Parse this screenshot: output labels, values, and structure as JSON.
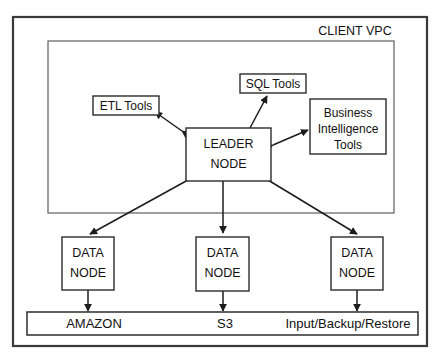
{
  "diagram": {
    "title": "CLIENT VPC",
    "outer_frame": {
      "name": "outer-frame"
    },
    "vpc_region": {
      "label": "CLIENT VPC",
      "label_position": "top-right"
    },
    "nodes": [
      {
        "id": "etl-tools",
        "label": "ETL Tools",
        "lines": [
          "ETL Tools"
        ],
        "kind": "tool"
      },
      {
        "id": "sql-tools",
        "label": "SQL Tools",
        "lines": [
          "SQL Tools"
        ],
        "kind": "tool"
      },
      {
        "id": "bi-tools",
        "label": "Business Intelligence Tools",
        "lines": [
          "Business",
          "Intelligence",
          "Tools"
        ],
        "kind": "tool"
      },
      {
        "id": "leader-node",
        "label": "LEADER NODE",
        "lines": [
          "LEADER",
          "NODE"
        ],
        "kind": "node"
      },
      {
        "id": "data-node-1",
        "label": "DATA NODE",
        "lines": [
          "DATA",
          "NODE"
        ],
        "kind": "node"
      },
      {
        "id": "data-node-2",
        "label": "DATA NODE",
        "lines": [
          "DATA",
          "NODE"
        ],
        "kind": "node"
      },
      {
        "id": "data-node-3",
        "label": "DATA NODE",
        "lines": [
          "DATA",
          "NODE"
        ],
        "kind": "node"
      }
    ],
    "storage_bar": {
      "id": "storage-bar",
      "labels": [
        "AMAZON",
        "S3",
        "Input/Backup/Restore"
      ]
    },
    "connections": [
      {
        "from": "leader-node",
        "to": "etl-tools",
        "style": "double-arrow"
      },
      {
        "from": "leader-node",
        "to": "sql-tools",
        "style": "double-arrow"
      },
      {
        "from": "leader-node",
        "to": "bi-tools",
        "style": "double-arrow"
      },
      {
        "from": "leader-node",
        "to": "data-node-1",
        "style": "double-arrow"
      },
      {
        "from": "leader-node",
        "to": "data-node-2",
        "style": "double-arrow"
      },
      {
        "from": "leader-node",
        "to": "data-node-3",
        "style": "double-arrow"
      },
      {
        "from": "data-node-1",
        "to": "storage-bar",
        "style": "double-arrow"
      },
      {
        "from": "data-node-2",
        "to": "storage-bar",
        "style": "double-arrow"
      },
      {
        "from": "data-node-3",
        "to": "storage-bar",
        "style": "double-arrow"
      }
    ],
    "colors": {
      "background": "#ffffff",
      "stroke": "#1c1c1c",
      "frame": "#3a3a3a",
      "vpc_border": "#6a6a6a",
      "text": "#111111"
    }
  }
}
